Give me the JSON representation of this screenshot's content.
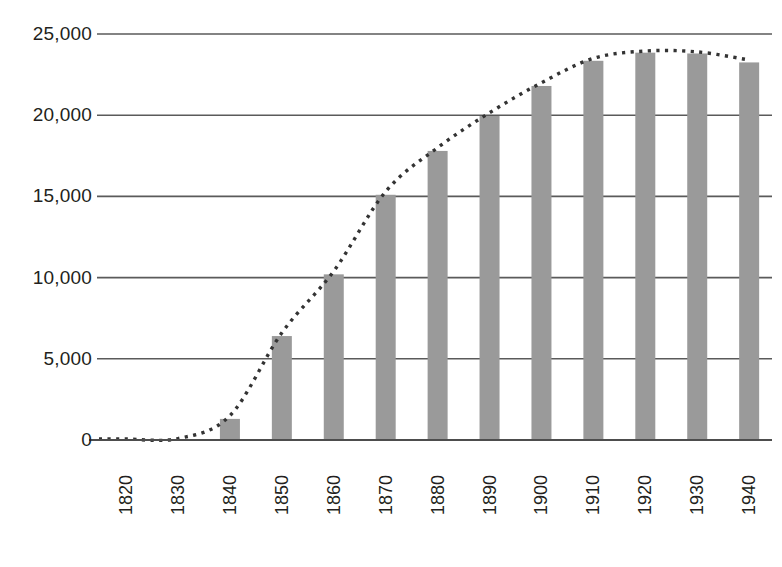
{
  "chart_data": {
    "type": "bar",
    "title": "",
    "subtitle": "",
    "xlabel": "",
    "ylabel": "",
    "categories": [
      "1820",
      "1830",
      "1840",
      "1850",
      "1860",
      "1870",
      "1880",
      "1890",
      "1900",
      "1910",
      "1920",
      "1930",
      "1940"
    ],
    "values": [
      0,
      0,
      1300,
      6400,
      10200,
      15100,
      17800,
      19950,
      21800,
      23350,
      23850,
      23800,
      23250
    ],
    "series": [
      {
        "name": "bars",
        "type": "bar",
        "values": [
          0,
          0,
          1300,
          6400,
          10200,
          15100,
          17800,
          19950,
          21800,
          23350,
          23850,
          23800,
          23250
        ]
      },
      {
        "name": "trend",
        "type": "line",
        "style": "dotted",
        "values": [
          60,
          90,
          1500,
          6600,
          10400,
          15300,
          18000,
          20150,
          22000,
          23500,
          23950,
          23900,
          23400
        ]
      }
    ],
    "ylim": [
      0,
      25000
    ],
    "yticks": [
      0,
      5000,
      10000,
      15000,
      20000,
      25000
    ],
    "ytick_labels": [
      "0",
      "5,000",
      "10,000",
      "15,000",
      "20,000",
      "25,000"
    ],
    "xtick_labels": [
      "1820",
      "1830",
      "1840",
      "1850",
      "1860",
      "1870",
      "1880",
      "1890",
      "1900",
      "1910",
      "1920",
      "1930",
      "1940"
    ],
    "grid": "horizontal",
    "legend": "none",
    "colors": {
      "bar": "#9a9a9a",
      "gridline": "#5a5a5a",
      "axis": "#4d4d4d",
      "trend": "#333333",
      "background": "#ffffff",
      "text": "#231f20"
    }
  }
}
